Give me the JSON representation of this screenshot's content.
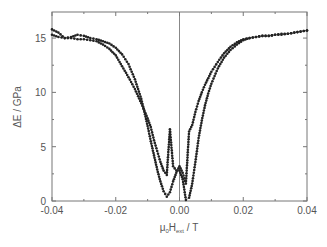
{
  "chart_data": {
    "type": "scatter",
    "title": "",
    "xlabel": "μ0Hext / T",
    "ylabel": "ΔE / GPa",
    "xlim": [
      -0.04,
      0.04
    ],
    "ylim": [
      0,
      17.4
    ],
    "xticks": [
      -0.04,
      -0.02,
      0.0,
      0.02,
      0.04
    ],
    "xtick_labels": [
      "-0.04",
      "-0.02",
      "0.00",
      "0.02",
      "0.04"
    ],
    "yticks": [
      0,
      5,
      10,
      15
    ],
    "ytick_labels": [
      "0",
      "5",
      "10",
      "15"
    ],
    "grid": false,
    "legend": null,
    "annotations": [
      "vertical line at x = 0"
    ],
    "series": [
      {
        "name": "sweep A (minimum left of zero)",
        "x": [
          -0.04,
          -0.038,
          -0.036,
          -0.034,
          -0.032,
          -0.03,
          -0.028,
          -0.026,
          -0.024,
          -0.022,
          -0.02,
          -0.018,
          -0.016,
          -0.014,
          -0.012,
          -0.011,
          -0.01,
          -0.009,
          -0.008,
          -0.007,
          -0.006,
          -0.005,
          -0.004,
          -0.003,
          -0.002,
          -0.001,
          0.0,
          0.001,
          0.002,
          0.003,
          0.004,
          0.005,
          0.006,
          0.007,
          0.008,
          0.009,
          0.01,
          0.012,
          0.014,
          0.016,
          0.018,
          0.02,
          0.022,
          0.024,
          0.026,
          0.028,
          0.03,
          0.032,
          0.034,
          0.036,
          0.038,
          0.04
        ],
        "y": [
          15.8,
          15.5,
          15.0,
          15.1,
          15.3,
          15.2,
          15.0,
          14.9,
          14.7,
          14.5,
          14.1,
          13.5,
          12.6,
          11.2,
          9.4,
          8.2,
          6.9,
          5.5,
          4.2,
          2.9,
          1.8,
          0.9,
          0.4,
          0.8,
          1.8,
          2.6,
          3.2,
          2.6,
          1.6,
          6.4,
          7.0,
          8.2,
          9.2,
          10.0,
          10.7,
          11.3,
          11.9,
          12.8,
          13.6,
          14.2,
          14.6,
          14.9,
          15.0,
          15.1,
          15.2,
          15.2,
          15.3,
          15.3,
          15.4,
          15.5,
          15.6,
          15.7
        ]
      },
      {
        "name": "sweep B (minimum right of zero)",
        "x": [
          -0.04,
          -0.038,
          -0.036,
          -0.034,
          -0.032,
          -0.03,
          -0.028,
          -0.026,
          -0.024,
          -0.022,
          -0.02,
          -0.018,
          -0.016,
          -0.014,
          -0.012,
          -0.01,
          -0.009,
          -0.008,
          -0.007,
          -0.006,
          -0.005,
          -0.004,
          -0.003,
          -0.002,
          -0.001,
          0.0,
          0.001,
          0.002,
          0.003,
          0.004,
          0.005,
          0.006,
          0.007,
          0.008,
          0.009,
          0.01,
          0.012,
          0.014,
          0.016,
          0.018,
          0.02,
          0.022,
          0.024,
          0.026,
          0.028,
          0.03,
          0.032,
          0.034,
          0.036,
          0.038,
          0.04
        ],
        "y": [
          15.3,
          15.1,
          15.0,
          15.0,
          14.9,
          14.9,
          14.8,
          14.7,
          14.4,
          14.0,
          13.4,
          12.4,
          11.4,
          10.3,
          9.0,
          7.6,
          6.8,
          5.6,
          4.6,
          3.6,
          2.8,
          2.4,
          6.6,
          3.2,
          2.8,
          2.8,
          2.0,
          0.1,
          0.3,
          1.6,
          3.6,
          5.8,
          7.4,
          8.8,
          9.9,
          10.8,
          12.2,
          13.2,
          13.9,
          14.4,
          14.8,
          15.0,
          15.1,
          15.2,
          15.2,
          15.3,
          15.4,
          15.4,
          15.5,
          15.6,
          15.7
        ]
      }
    ]
  },
  "axes": {
    "xlabel_mu": "μ",
    "xlabel_sub0": "0",
    "xlabel_H": "H",
    "xlabel_subext": "ext",
    "xlabel_unit": " / T",
    "ylabel": "ΔE / GPa"
  }
}
